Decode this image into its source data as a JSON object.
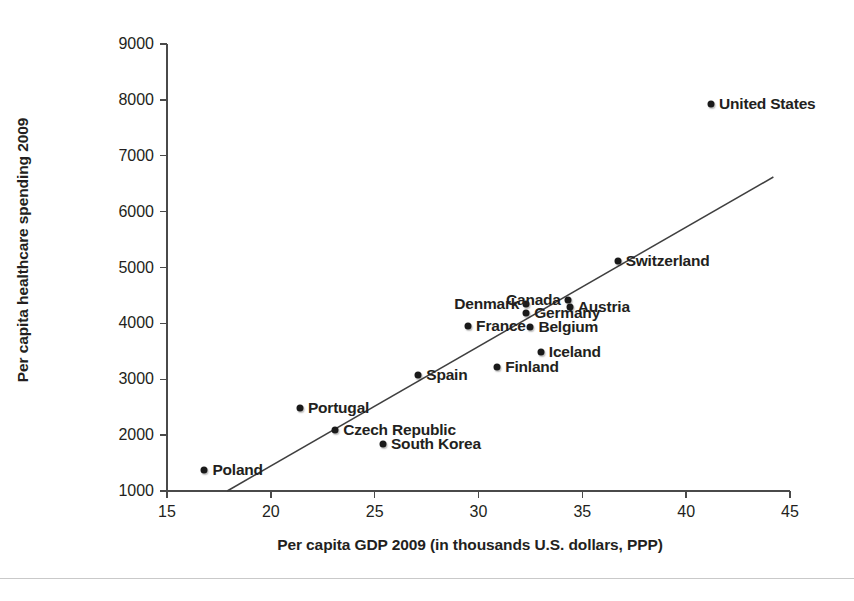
{
  "chart_data": {
    "type": "scatter",
    "title": "",
    "xlabel": "Per capita GDP 2009 (in thousands U.S. dollars, PPP)",
    "ylabel": "Per capita healthcare spending 2009",
    "xlim": [
      15,
      45
    ],
    "ylim": [
      1000,
      9000
    ],
    "xticks": [
      15,
      20,
      25,
      30,
      35,
      40,
      45
    ],
    "yticks": [
      1000,
      2000,
      3000,
      4000,
      5000,
      6000,
      7000,
      8000,
      9000
    ],
    "grid": false,
    "legend": "none",
    "points": [
      {
        "label": "Poland",
        "x": 16.8,
        "y": 1380,
        "label_side": "left"
      },
      {
        "label": "Portugal",
        "x": 21.4,
        "y": 2490,
        "label_side": "left"
      },
      {
        "label": "Czech Republic",
        "x": 23.1,
        "y": 2100,
        "label_side": "left"
      },
      {
        "label": "South Korea",
        "x": 25.4,
        "y": 1850,
        "label_side": "left"
      },
      {
        "label": "Spain",
        "x": 27.1,
        "y": 3070,
        "label_side": "left"
      },
      {
        "label": "France",
        "x": 29.5,
        "y": 3960,
        "label_side": "left"
      },
      {
        "label": "Finland",
        "x": 30.9,
        "y": 3220,
        "label_side": "left"
      },
      {
        "label": "Denmark",
        "x": 32.3,
        "y": 4350,
        "label_side": "right"
      },
      {
        "label": "Germany",
        "x": 32.3,
        "y": 4190,
        "label_side": "left"
      },
      {
        "label": "Belgium",
        "x": 32.5,
        "y": 3930,
        "label_side": "left"
      },
      {
        "label": "Iceland",
        "x": 33.0,
        "y": 3480,
        "label_side": "left"
      },
      {
        "label": "Canada",
        "x": 34.3,
        "y": 4420,
        "label_side": "right"
      },
      {
        "label": "Austria",
        "x": 34.4,
        "y": 4290,
        "label_side": "left"
      },
      {
        "label": "Switzerland",
        "x": 36.7,
        "y": 5110,
        "label_side": "left"
      },
      {
        "label": "United States",
        "x": 41.2,
        "y": 7920,
        "label_side": "left"
      }
    ],
    "trendline": {
      "x_start": 17.9,
      "y_start": 1000,
      "x_end": 44.2,
      "y_end": 6620
    },
    "annotations": []
  }
}
